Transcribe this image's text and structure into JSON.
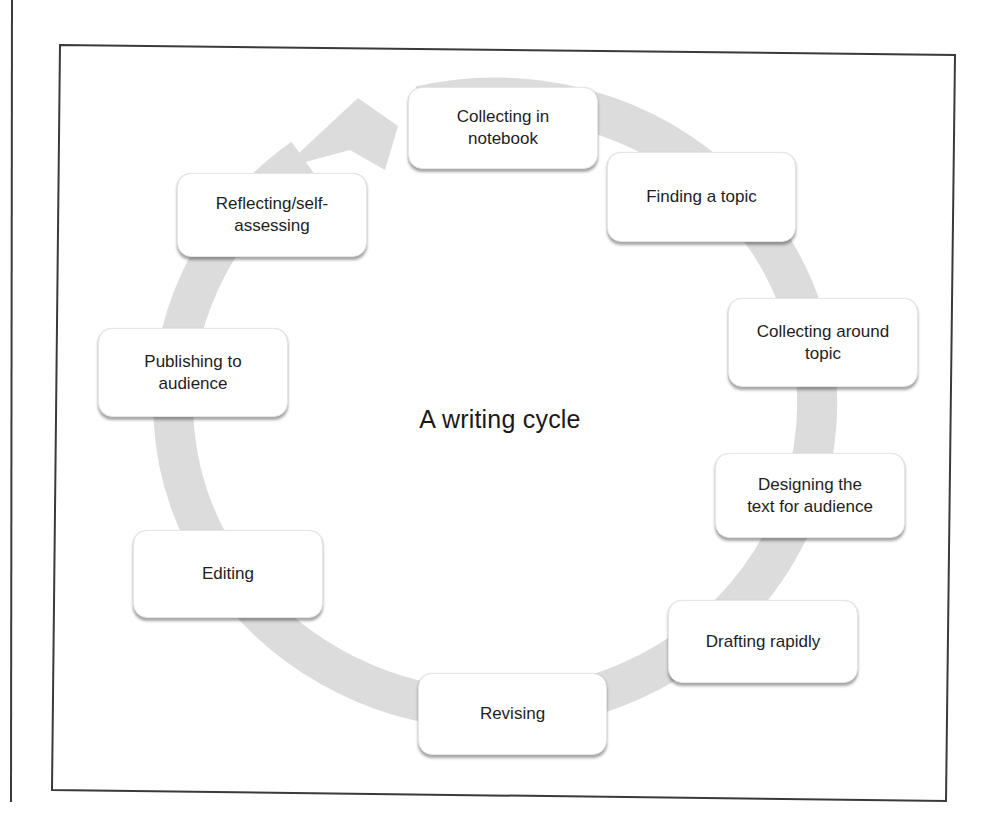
{
  "diagram": {
    "title": "A writing cycle",
    "type": "cycle",
    "colors": {
      "ring": "#dcdcdc",
      "frame": "#3a3a3a",
      "node_fill": "#ffffff",
      "node_border": "#e6e6e6",
      "text": "#1e1e1e"
    },
    "nodes": [
      {
        "id": "n1",
        "label": "Collecting in\nnotebook"
      },
      {
        "id": "n2",
        "label": "Finding a topic"
      },
      {
        "id": "n3",
        "label": "Collecting around\ntopic"
      },
      {
        "id": "n4",
        "label": "Designing the\ntext for audience"
      },
      {
        "id": "n5",
        "label": "Drafting rapidly"
      },
      {
        "id": "n6",
        "label": "Revising"
      },
      {
        "id": "n7",
        "label": "Editing"
      },
      {
        "id": "n8",
        "label": "Publishing to\naudience"
      },
      {
        "id": "n9",
        "label": "Reflecting/self-\nassessing"
      }
    ],
    "edges": [
      {
        "from": "n1",
        "to": "n2"
      },
      {
        "from": "n2",
        "to": "n3"
      },
      {
        "from": "n3",
        "to": "n4"
      },
      {
        "from": "n4",
        "to": "n5"
      },
      {
        "from": "n5",
        "to": "n6"
      },
      {
        "from": "n6",
        "to": "n7"
      },
      {
        "from": "n7",
        "to": "n8"
      },
      {
        "from": "n8",
        "to": "n9"
      },
      {
        "from": "n9",
        "to": "n1"
      }
    ],
    "direction": "clockwise"
  }
}
